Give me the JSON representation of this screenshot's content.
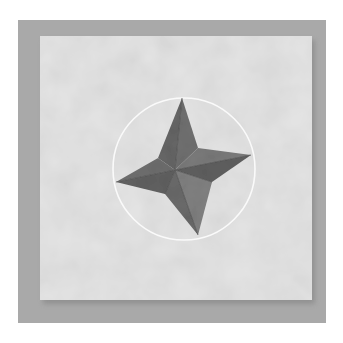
{
  "image": {
    "subject": "folded fabric four-point star on a quilt block",
    "colors": {
      "page": "#ffffff",
      "backdrop": "#a9a9a9",
      "fabric": "#e4e4e4",
      "circle_stroke": "#fafafa",
      "star_dark": "#5c5c5c",
      "star_mid": "#707070",
      "star_light": "#858585"
    },
    "backdrop": {
      "x": 18,
      "y": 20,
      "w": 308,
      "h": 303
    },
    "fabric_square": {
      "x": 40,
      "y": 36,
      "w": 272,
      "h": 264
    },
    "circle": {
      "cx": 184,
      "cy": 169,
      "r": 71
    },
    "star": {
      "center": [
        175,
        170
      ],
      "points": {
        "top": [
          182,
          98
        ],
        "right": [
          251,
          155
        ],
        "bottom": [
          198,
          235
        ],
        "left": [
          116,
          182
        ]
      }
    }
  }
}
